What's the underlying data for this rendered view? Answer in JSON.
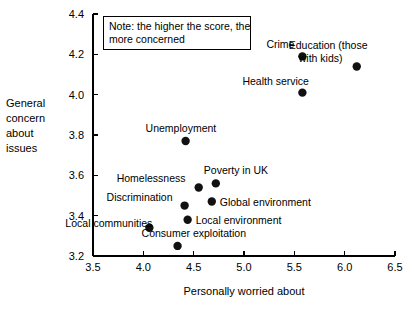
{
  "chart_data": {
    "type": "scatter",
    "title": "",
    "xlabel": "Personally worried about",
    "ylabel": "General concern about issues",
    "ylabel_lines": [
      "General",
      "concern",
      "about",
      "issues"
    ],
    "xlim": [
      3.5,
      6.5
    ],
    "ylim": [
      3.2,
      4.4
    ],
    "xticks": [
      "3.5",
      "4.0",
      "4.5",
      "5.0",
      "5.5",
      "6.0",
      "6.5"
    ],
    "xtick_values": [
      3.5,
      4.0,
      4.5,
      5.0,
      5.5,
      6.0,
      6.5
    ],
    "yticks": [
      "3.2",
      "3.4",
      "3.6",
      "3.8",
      "4.0",
      "4.2",
      "4.4"
    ],
    "ytick_values": [
      3.2,
      3.4,
      3.6,
      3.8,
      4.0,
      4.2,
      4.4
    ],
    "grid": false,
    "legend": "none",
    "marker_color": "#111111",
    "annotation": "Note: the higher the score, the more concerned",
    "annotation_lines": [
      "Note: the higher the score, the",
      "more concerned"
    ],
    "points": [
      {
        "label": "Crime",
        "x": 5.58,
        "y": 4.19,
        "label_dx": -36,
        "label_dy": -8,
        "label_anchor": "start"
      },
      {
        "label": "Education (those",
        "label2": "with kids)",
        "x": 6.12,
        "y": 4.14,
        "label_dx": -68,
        "label_dy": -17,
        "label_anchor": "start"
      },
      {
        "label": "Health service",
        "x": 5.58,
        "y": 4.01,
        "label_dx": -60,
        "label_dy": -8,
        "label_anchor": "start"
      },
      {
        "label": "Unemployment",
        "x": 4.42,
        "y": 3.77,
        "label_dx": -40,
        "label_dy": -9,
        "label_anchor": "start"
      },
      {
        "label": "Poverty in UK",
        "x": 4.72,
        "y": 3.56,
        "label_dx": -12,
        "label_dy": -9,
        "label_anchor": "start"
      },
      {
        "label": "Homelessness",
        "x": 4.55,
        "y": 3.54,
        "label_dx": -82,
        "label_dy": -5,
        "label_anchor": "start"
      },
      {
        "label": "Global environment",
        "x": 4.68,
        "y": 3.47,
        "label_dx": 8,
        "label_dy": 4,
        "label_anchor": "start"
      },
      {
        "label": "Discrimination",
        "x": 4.41,
        "y": 3.45,
        "label_dx": -78,
        "label_dy": -5,
        "label_anchor": "start"
      },
      {
        "label": "Local environment",
        "x": 4.44,
        "y": 3.38,
        "label_dx": 8,
        "label_dy": 4,
        "label_anchor": "start"
      },
      {
        "label": "Local communities",
        "x": 4.06,
        "y": 3.34,
        "label_dx": -84,
        "label_dy": -1,
        "label_anchor": "start"
      },
      {
        "label": "Consumer exploitation",
        "x": 4.34,
        "y": 3.25,
        "label_dx": -36,
        "label_dy": -9,
        "label_anchor": "start"
      }
    ]
  }
}
